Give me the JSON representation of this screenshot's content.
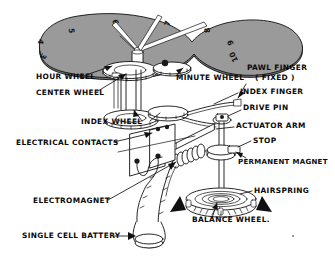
{
  "figure": {
    "dial": {
      "name": "clock-dial",
      "color": "#9a9a9a",
      "outline_color": "#111111",
      "numbers": [
        "3",
        "4",
        "5",
        "6",
        "7",
        "8",
        "9",
        "10"
      ],
      "hands": [
        "hour-hand",
        "minute-hand",
        "second-hand"
      ]
    },
    "colors": {
      "ink": "#111111",
      "paper": "#ffffff",
      "dial_gray": "#9a9a9a",
      "shadow_gray": "#6f6f6f"
    },
    "labels": [
      {
        "id": "hour-wheel",
        "text": "HOUR WHEEL",
        "x": 36,
        "y": 79,
        "anchor": "start"
      },
      {
        "id": "center-wheel",
        "text": "CENTER WHEEL",
        "x": 36,
        "y": 95,
        "anchor": "start"
      },
      {
        "id": "minute-wheel",
        "text": "MINUTE WHEEL",
        "x": 176,
        "y": 80,
        "anchor": "start"
      },
      {
        "id": "pawl-finger",
        "text": "PAWL FINGER",
        "x": 247,
        "y": 70,
        "anchor": "start"
      },
      {
        "id": "pawl-finger-fixed",
        "text": "( FIXED )",
        "x": 255,
        "y": 80,
        "anchor": "start"
      },
      {
        "id": "index-finger",
        "text": "INDEX FINGER",
        "x": 240,
        "y": 94,
        "anchor": "start"
      },
      {
        "id": "drive-pin",
        "text": "DRIVE PIN",
        "x": 243,
        "y": 110,
        "anchor": "start"
      },
      {
        "id": "index-wheel",
        "text": "INDEX WHEEL",
        "x": 81,
        "y": 124,
        "anchor": "start"
      },
      {
        "id": "actuator-arm",
        "text": "ACTUATOR ARM",
        "x": 236,
        "y": 128,
        "anchor": "start"
      },
      {
        "id": "electrical-contacts",
        "text": "ELECTRICAL CONTACTS",
        "x": 16,
        "y": 145,
        "anchor": "start"
      },
      {
        "id": "stop",
        "text": "STOP",
        "x": 253,
        "y": 143,
        "anchor": "start"
      },
      {
        "id": "permanent-magnet",
        "text": "PERMANENT MAGNET",
        "x": 238,
        "y": 164,
        "anchor": "start"
      },
      {
        "id": "hairspring",
        "text": "HAIRSPRING",
        "x": 254,
        "y": 193,
        "anchor": "start"
      },
      {
        "id": "electromagnet",
        "text": "ELECTROMAGNET",
        "x": 33,
        "y": 203,
        "anchor": "start"
      },
      {
        "id": "balance-wheel",
        "text": "BALANCE WHEEL.",
        "x": 192,
        "y": 222,
        "anchor": "start"
      },
      {
        "id": "single-cell-battery",
        "text": "SINGLE CELL BATTERY",
        "x": 22,
        "y": 238,
        "anchor": "start"
      }
    ],
    "dial_numbers": [
      {
        "value": "3",
        "x": 41,
        "y": 55,
        "rotate": 118
      },
      {
        "value": "4",
        "x": 38,
        "y": 41,
        "rotate": 104
      },
      {
        "value": "5",
        "x": 69,
        "y": 31,
        "rotate": 86
      },
      {
        "value": "6",
        "x": 113,
        "y": 23,
        "rotate": 70
      },
      {
        "value": "7",
        "x": 170,
        "y": 24,
        "rotate": 285
      },
      {
        "value": "8",
        "x": 210,
        "y": 30,
        "rotate": 262
      },
      {
        "value": "9",
        "x": 233,
        "y": 42,
        "rotate": 252
      },
      {
        "value": "10",
        "x": 236,
        "y": 56,
        "rotate": 245
      }
    ],
    "rotation_arrows": [
      "balance-wheel-arrow-left",
      "balance-wheel-arrow-right"
    ]
  }
}
